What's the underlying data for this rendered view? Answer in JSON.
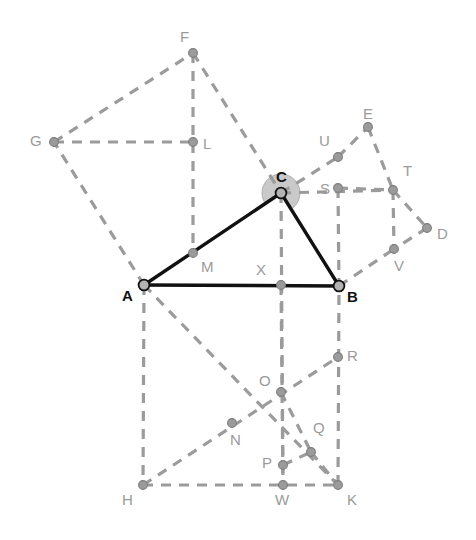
{
  "figure": {
    "width": 476,
    "height": 540,
    "background": "#ffffff"
  },
  "style": {
    "dashed_color": "#9b9b9b",
    "solid_color": "#111111",
    "node_fill": "#9b9b9b",
    "node_stroke": "#7d7d7d",
    "primary_node_fill": "#b3b3b3",
    "primary_node_stroke": "#111111",
    "angle_fill": "#c9c9c9",
    "angle_stroke": "#b0b0b0",
    "dash_pattern": "10 8",
    "dashed_width": 3.2,
    "solid_width": 3.4
  },
  "points": [
    {
      "id": "A",
      "label": "A",
      "x": 144,
      "y": 285,
      "kind": "primary",
      "lx": 122,
      "ly": 288
    },
    {
      "id": "B",
      "label": "B",
      "x": 339,
      "y": 286,
      "kind": "primary",
      "lx": 347,
      "ly": 289
    },
    {
      "id": "C",
      "label": "C",
      "x": 281,
      "y": 193,
      "kind": "primary",
      "lx": 276,
      "ly": 169
    },
    {
      "id": "D",
      "label": "D",
      "x": 427,
      "y": 228,
      "kind": "node",
      "lx": 437,
      "ly": 226
    },
    {
      "id": "E",
      "label": "E",
      "x": 368,
      "y": 127,
      "kind": "node",
      "lx": 363,
      "ly": 106
    },
    {
      "id": "F",
      "label": "F",
      "x": 193,
      "y": 53,
      "kind": "node",
      "lx": 180,
      "ly": 29
    },
    {
      "id": "G",
      "label": "G",
      "x": 54,
      "y": 142,
      "kind": "node",
      "lx": 30,
      "ly": 133
    },
    {
      "id": "H",
      "label": "H",
      "x": 143,
      "y": 485,
      "kind": "node",
      "lx": 122,
      "ly": 492
    },
    {
      "id": "K",
      "label": "K",
      "x": 338,
      "y": 485,
      "kind": "node",
      "lx": 347,
      "ly": 492
    },
    {
      "id": "L",
      "label": "L",
      "x": 193,
      "y": 142,
      "kind": "node",
      "lx": 203,
      "ly": 136
    },
    {
      "id": "M",
      "label": "M",
      "x": 193,
      "y": 253,
      "kind": "node",
      "lx": 201,
      "ly": 259
    },
    {
      "id": "N",
      "label": "N",
      "x": 232,
      "y": 423,
      "kind": "node",
      "lx": 230,
      "ly": 432
    },
    {
      "id": "O",
      "label": "O",
      "x": 281,
      "y": 392,
      "kind": "node",
      "lx": 259,
      "ly": 373
    },
    {
      "id": "P",
      "label": "P",
      "x": 283,
      "y": 465,
      "kind": "node",
      "lx": 262,
      "ly": 455
    },
    {
      "id": "Q",
      "label": "Q",
      "x": 311,
      "y": 452,
      "kind": "node",
      "lx": 313,
      "ly": 420
    },
    {
      "id": "R",
      "label": "R",
      "x": 338,
      "y": 357,
      "kind": "node",
      "lx": 347,
      "ly": 348
    },
    {
      "id": "S",
      "label": "S",
      "x": 338,
      "y": 188,
      "kind": "node",
      "lx": 320,
      "ly": 181
    },
    {
      "id": "T",
      "label": "T",
      "x": 393,
      "y": 190,
      "kind": "node",
      "lx": 403,
      "ly": 163
    },
    {
      "id": "U",
      "label": "U",
      "x": 338,
      "y": 157,
      "kind": "node",
      "lx": 319,
      "ly": 133
    },
    {
      "id": "V",
      "label": "V",
      "x": 394,
      "y": 249,
      "kind": "node",
      "lx": 394,
      "ly": 258
    },
    {
      "id": "W",
      "label": "W",
      "x": 283,
      "y": 485,
      "kind": "node",
      "lx": 275,
      "ly": 492
    },
    {
      "id": "X",
      "label": "X",
      "x": 281,
      "y": 285,
      "kind": "node",
      "lx": 256,
      "ly": 262
    }
  ],
  "solid_edges": [
    {
      "name": "edge-A-B",
      "from": "A",
      "to": "B"
    },
    {
      "name": "edge-A-C",
      "from": "A",
      "to": "C"
    },
    {
      "name": "edge-C-B",
      "from": "C",
      "to": "B"
    }
  ],
  "dashed_edges": [
    {
      "name": "edge-A-G",
      "from": "A",
      "to": "G"
    },
    {
      "name": "edge-G-F",
      "from": "G",
      "to": "F"
    },
    {
      "name": "edge-F-C",
      "from": "F",
      "to": "C"
    },
    {
      "name": "edge-G-L",
      "from": "G",
      "to": "L"
    },
    {
      "name": "edge-F-M",
      "from": "F",
      "to": "M"
    },
    {
      "name": "edge-A-H",
      "from": "A",
      "to": "H"
    },
    {
      "name": "edge-H-K",
      "from": "H",
      "to": "K"
    },
    {
      "name": "edge-K-B",
      "from": "K",
      "to": "B"
    },
    {
      "name": "edge-A-N-K",
      "from": "A",
      "to": "K"
    },
    {
      "name": "edge-H-R",
      "from": "H",
      "to": "R"
    },
    {
      "name": "edge-X-W",
      "from": "X",
      "to": "W"
    },
    {
      "name": "edge-O-Q",
      "from": "O",
      "to": "Q"
    },
    {
      "name": "edge-P-Q",
      "from": "P",
      "to": "Q"
    },
    {
      "name": "edge-Q-K",
      "from": "Q",
      "to": "K"
    },
    {
      "name": "edge-C-U",
      "from": "C",
      "to": "U"
    },
    {
      "name": "edge-U-E",
      "from": "U",
      "to": "E"
    },
    {
      "name": "edge-E-T",
      "from": "E",
      "to": "T"
    },
    {
      "name": "edge-S-T",
      "from": "S",
      "to": "T"
    },
    {
      "name": "edge-C-S-T",
      "from": "C",
      "to": "T"
    },
    {
      "name": "edge-S-B",
      "from": "S",
      "to": "B"
    },
    {
      "name": "edge-T-V",
      "from": "T",
      "to": "V"
    },
    {
      "name": "edge-T-D",
      "from": "T",
      "to": "D"
    },
    {
      "name": "edge-D-V",
      "from": "D",
      "to": "V"
    },
    {
      "name": "edge-B-V",
      "from": "B",
      "to": "V"
    },
    {
      "name": "edge-C-X-W",
      "from": "C",
      "to": "W"
    }
  ],
  "angle_marker": {
    "name": "angle-ACB",
    "vertex": "C",
    "radius": 19,
    "arm_start": "A",
    "arm_end": "B"
  }
}
